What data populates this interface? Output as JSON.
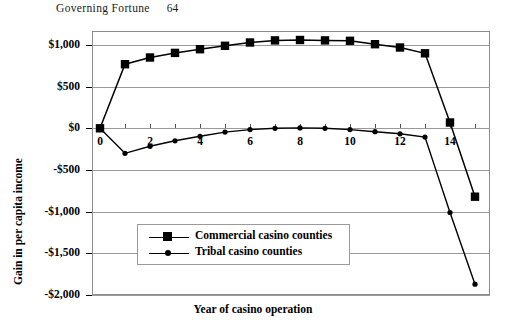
{
  "running_head": {
    "title": "Governing Fortune",
    "folio": "64"
  },
  "chart_data": {
    "type": "line",
    "title": "",
    "xlabel": "Year of casino operation",
    "ylabel": "Gain in per capita income",
    "x": [
      0,
      1,
      2,
      3,
      4,
      5,
      6,
      7,
      8,
      9,
      10,
      11,
      12,
      13,
      14,
      15
    ],
    "xlim": [
      0,
      15.6
    ],
    "ylim": [
      -2000,
      1150
    ],
    "xticks": [
      0,
      1,
      2,
      3,
      4,
      5,
      6,
      7,
      8,
      9,
      10,
      11,
      12,
      13,
      14,
      15
    ],
    "xtick_labels": [
      "0",
      "",
      "2",
      "",
      "4",
      "",
      "6",
      "",
      "8",
      "",
      "10",
      "",
      "12",
      "",
      "14",
      ""
    ],
    "ytick_labels": [
      "$1,000",
      "$500",
      "$0",
      "-$500",
      "-$1,000",
      "-$1,500",
      "-$2,000"
    ],
    "yticks": [
      1000,
      500,
      0,
      -500,
      -1000,
      -1500,
      -2000
    ],
    "grid": "horizontal",
    "legend_position": "lower-center",
    "series": [
      {
        "name": "Commercial casino counties",
        "marker": "square",
        "values": [
          0,
          770,
          850,
          905,
          950,
          990,
          1030,
          1055,
          1060,
          1055,
          1050,
          1010,
          970,
          900,
          70,
          -820
        ]
      },
      {
        "name": "Tribal casino counties",
        "marker": "circle",
        "values": [
          0,
          -300,
          -215,
          -150,
          -95,
          -45,
          -15,
          0,
          5,
          0,
          -15,
          -40,
          -65,
          -105,
          -1010,
          -1870
        ]
      }
    ]
  }
}
